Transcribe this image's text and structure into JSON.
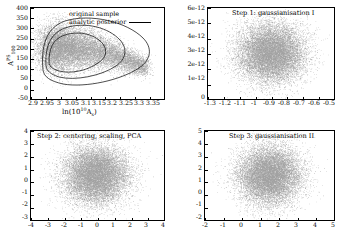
{
  "figure": {
    "panels": [
      {
        "id": "original-sample",
        "title": "",
        "xlabel_html": "ln(10^10 A_s)",
        "ylabel_html": "A^PS_100",
        "xticks": [
          "2.9",
          "2.95",
          "3",
          "3.05",
          "3.1",
          "3.15",
          "3.2",
          "3.25",
          "3.3",
          "3.35"
        ],
        "yticks": [
          "400",
          "350",
          "300",
          "250",
          "200",
          "150",
          "100",
          "50",
          "0",
          "-50"
        ],
        "legend": {
          "sample_label": "original sample",
          "posterior_label": "analytic posterior"
        }
      },
      {
        "id": "step1",
        "title": "Step 1: gaussianisation I",
        "xticks": [
          "-1.3",
          "-1.2",
          "-1.1",
          "-1",
          "-0.9",
          "-0.8",
          "-0.7",
          "-0.6",
          "-0.5"
        ],
        "yticks": [
          "6e-12",
          "5e-12",
          "4e-12",
          "3e-12",
          "2e-12",
          "1e-12",
          "0"
        ]
      },
      {
        "id": "step2",
        "title": "Step 2: centering, scaling, PCA",
        "xticks": [
          "-4",
          "-3",
          "-2",
          "-1",
          "0",
          "1",
          "2",
          "3",
          "4"
        ],
        "yticks": [
          "4",
          "3",
          "2",
          "1",
          "0",
          "-1",
          "-2",
          "-3"
        ]
      },
      {
        "id": "step3",
        "title": "Step 3: gaussianisation II",
        "xticks": [
          "-2",
          "-1",
          "0",
          "1",
          "2",
          "3",
          "4",
          "5"
        ],
        "yticks": [
          "5",
          "4",
          "3",
          "2",
          "1",
          "0",
          "-1",
          "-2"
        ]
      }
    ]
  },
  "chart_data": [
    {
      "type": "scatter",
      "panel": "original-sample",
      "title": "",
      "xlabel": "ln(10^10 A_s)",
      "ylabel": "A^PS_100",
      "xlim": [
        2.88,
        3.37
      ],
      "ylim": [
        -50,
        400
      ],
      "xticks": [
        2.9,
        2.95,
        3.0,
        3.05,
        3.1,
        3.15,
        3.2,
        3.25,
        3.3,
        3.35
      ],
      "yticks": [
        -50,
        0,
        50,
        100,
        150,
        200,
        250,
        300,
        350,
        400
      ],
      "grid": false,
      "legend": [
        "original sample",
        "analytic posterior"
      ],
      "legend_position": "upper right",
      "description": "Banana/comma shaped degenerate posterior cloud of grey points peaking near ln(10^10 As)=2.95-3.05, A^PS_100=120-230, with long tail extending to ln(10^10 As)=3.35 at low amplitude. Three nested analytic posterior contour curves overlaid.",
      "cloud": {
        "x_mode": 2.98,
        "y_mode": 170,
        "x_range": [
          2.93,
          3.33
        ],
        "y_range": [
          -10,
          330
        ]
      },
      "contour_levels": 3
    },
    {
      "type": "scatter",
      "panel": "step1",
      "title": "Step 1: gaussianisation I",
      "xlabel": "",
      "ylabel": "",
      "xlim": [
        -1.35,
        -0.47
      ],
      "ylim": [
        0,
        6.2e-12
      ],
      "xticks": [
        -1.3,
        -1.2,
        -1.1,
        -1.0,
        -0.9,
        -0.8,
        -0.7,
        -0.6,
        -0.5
      ],
      "yticks": [
        0,
        1e-12,
        2e-12,
        3e-12,
        4e-12,
        5e-12,
        6e-12
      ],
      "grid": false,
      "description": "Roughly round/elliptical grey point cloud centred near x=-0.93, y=2.6e-12.",
      "cloud": {
        "x_mode": -0.93,
        "y_mode": 2.6e-12,
        "x_range": [
          -1.22,
          -0.62
        ],
        "y_range": [
          6e-13,
          4.8e-12
        ]
      }
    },
    {
      "type": "scatter",
      "panel": "step2",
      "title": "Step 2: centering, scaling, PCA",
      "xlabel": "",
      "ylabel": "",
      "xlim": [
        -4,
        4
      ],
      "ylim": [
        -3,
        4
      ],
      "xticks": [
        -4,
        -3,
        -2,
        -1,
        0,
        1,
        2,
        3,
        4
      ],
      "yticks": [
        -3,
        -2,
        -1,
        0,
        1,
        2,
        3,
        4
      ],
      "grid": false,
      "description": "Round grey point cloud centred near x=-0.1, y=0.1 with radius about 2.3 units.",
      "cloud": {
        "x_mode": -0.1,
        "y_mode": 0.1,
        "x_range": [
          -2.4,
          2.3
        ],
        "y_range": [
          -2.3,
          2.6
        ]
      }
    },
    {
      "type": "scatter",
      "panel": "step3",
      "title": "Step 3: gaussianisation II",
      "xlabel": "",
      "ylabel": "",
      "xlim": [
        -2,
        5
      ],
      "ylim": [
        -2,
        5
      ],
      "xticks": [
        -2,
        -1,
        0,
        1,
        2,
        3,
        4,
        5
      ],
      "yticks": [
        -2,
        -1,
        0,
        1,
        2,
        3,
        4,
        5
      ],
      "grid": false,
      "description": "Round grey point cloud centred near x=1.7, y=1.7 with radius about 1.9 units.",
      "cloud": {
        "x_mode": 1.7,
        "y_mode": 1.7,
        "x_range": [
          -0.3,
          3.9
        ],
        "y_range": [
          -0.4,
          3.8
        ]
      }
    }
  ],
  "style": {
    "point_color": "#555555",
    "axis_color": "#000000",
    "background": "#ffffff"
  }
}
